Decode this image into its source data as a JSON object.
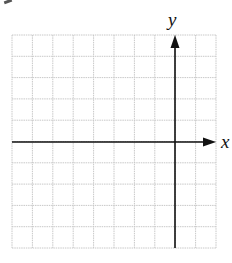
{
  "diagram": {
    "type": "coordinate-grid",
    "grid": {
      "columns": 10,
      "rows": 10,
      "left": 12,
      "top": 35,
      "right": 216,
      "bottom": 248,
      "line_color": "#c8c8c8"
    },
    "x_axis": {
      "label": "x",
      "y": 142,
      "from": 12,
      "to": 216,
      "arrow": "right"
    },
    "y_axis": {
      "label": "y",
      "x": 175,
      "from": 248,
      "to": 35,
      "arrow": "up"
    },
    "axis_color": "#111111"
  }
}
